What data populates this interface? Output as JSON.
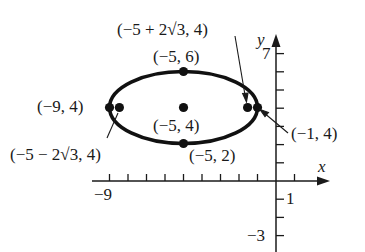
{
  "diagram": {
    "type": "ellipse-graph",
    "axes": {
      "x_label": "x",
      "y_label": "y",
      "x_tick_labels": [
        {
          "value": -9,
          "text": "−9"
        },
        {
          "value": 1,
          "text": "1"
        }
      ],
      "y_tick_labels": [
        {
          "value": 7,
          "text": "7"
        },
        {
          "value": -3,
          "text": "−3"
        }
      ],
      "x_range": [
        -9,
        1
      ],
      "y_range": [
        -3,
        7
      ]
    },
    "ellipse": {
      "center": [
        -5,
        4
      ],
      "semi_major": 4,
      "semi_minor": 2,
      "orientation": "horizontal"
    },
    "points": [
      {
        "id": "center",
        "coords": [
          -5,
          4
        ],
        "label": "(−5, 4)"
      },
      {
        "id": "top-vertex",
        "coords": [
          -5,
          6
        ],
        "label": "(−5, 6)"
      },
      {
        "id": "bottom-vertex",
        "coords": [
          -5,
          2
        ],
        "label": "(−5, 2)"
      },
      {
        "id": "left-vertex",
        "coords": [
          -9,
          4
        ],
        "label": "(−9, 4)"
      },
      {
        "id": "right-vertex",
        "coords": [
          -1,
          4
        ],
        "label": "(−1, 4)"
      },
      {
        "id": "right-focus",
        "coords": [
          "-5+2√3",
          4
        ],
        "label": "(−5 + 2√3, 4)"
      },
      {
        "id": "left-focus",
        "coords": [
          "-5-2√3",
          4
        ],
        "label": "(−5 − 2√3, 4)"
      }
    ]
  },
  "colors": {
    "ink": "#1a1a1a",
    "background": "#ffffff"
  }
}
